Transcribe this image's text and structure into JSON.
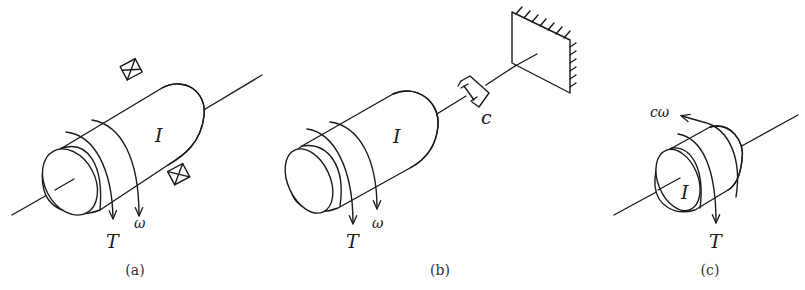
{
  "figure": {
    "panels": [
      {
        "id": "a",
        "caption": "(a)",
        "labels": {
          "inertia": "I",
          "torque": "T",
          "angular_velocity": "ω"
        },
        "components": [
          "shaft",
          "cylinder-rotor",
          "bearing-top",
          "bearing-bottom",
          "torque-arrow",
          "omega-arrow"
        ]
      },
      {
        "id": "b",
        "caption": "(b)",
        "labels": {
          "inertia": "I",
          "torque": "T",
          "angular_velocity": "ω",
          "damping": "c"
        },
        "components": [
          "cylinder-rotor",
          "shaft",
          "rotary-damper",
          "fixed-wall",
          "torque-arrow",
          "omega-arrow"
        ]
      },
      {
        "id": "c",
        "caption": "(c)",
        "labels": {
          "inertia": "I",
          "torque": "T",
          "damping_torque": "cω"
        },
        "components": [
          "shaft",
          "disk-rotor",
          "torque-arrow",
          "damping-torque-arrow"
        ]
      }
    ]
  },
  "colors": {
    "line": "#1a1a1a",
    "background": "#ffffff"
  }
}
